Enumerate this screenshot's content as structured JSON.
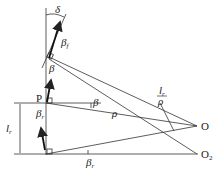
{
  "diagram": {
    "labels": {
      "delta": "δ",
      "beta_f": "β",
      "beta_f_sub": "f",
      "beta_top": "β",
      "P": "P",
      "beta_mid": "β",
      "rho": "ρ",
      "lr_over_rho_num": "l",
      "lr_over_rho_num_sub": "r",
      "lr_over_rho_den": "ρ",
      "O": "O",
      "O2": "O",
      "O2_sub": "2",
      "lr": "l",
      "lr_sub": "r",
      "beta_r_left": "β",
      "beta_r_left_sub": "r",
      "beta_r_bottom": "β",
      "beta_r_bottom_sub": "r"
    },
    "colors": {
      "line": "#333333",
      "background": "#ffffff"
    }
  }
}
